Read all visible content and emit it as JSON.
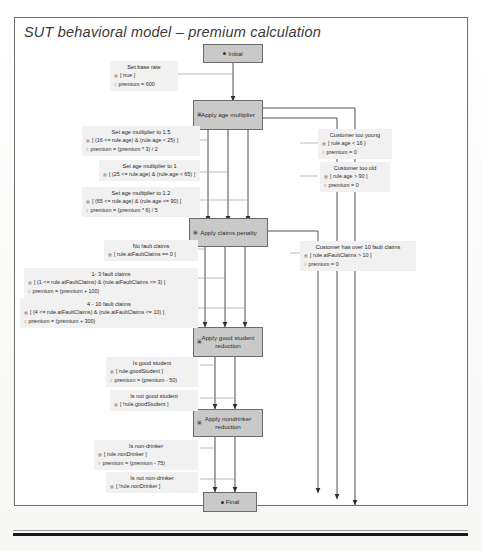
{
  "document": {
    "figure_title": "SUT behavioral model – premium calculation"
  },
  "diagram": {
    "type": "uml-state-machine",
    "palette": {
      "node_fill": "#c9c9c9",
      "node_stroke": "#6a6a6a",
      "label_fill": "#f1f1f1",
      "edge_stroke": "#3a3a3a",
      "frame_stroke": "#6f6f6f",
      "rule_color": "#1a1a1a"
    },
    "nodes": [
      {
        "id": "initial",
        "label": "Initial",
        "kind": "initial-pseudostate"
      },
      {
        "id": "age",
        "label": "Apply age multiplier",
        "kind": "state"
      },
      {
        "id": "claims",
        "label": "Apply claims penalty",
        "kind": "state"
      },
      {
        "id": "student",
        "label": "Apply good student reduction",
        "kind": "state"
      },
      {
        "id": "drinker",
        "label": "Apply nondrinker reduction",
        "kind": "state"
      },
      {
        "id": "final",
        "label": "Final",
        "kind": "final-state"
      }
    ],
    "transitions": [
      {
        "id": "t-base-rate",
        "name": "Set base rate",
        "guard": "[ true ]",
        "effect": "premium = 600",
        "from": "initial",
        "to": "age"
      },
      {
        "id": "t-age-15",
        "name": "Set age multiplier to 1.5",
        "guard": "[ (16 <= rule.age) & (rule.age < 25) ]",
        "effect": "premium = (premium * 3) / 2",
        "from": "age",
        "to": "claims"
      },
      {
        "id": "t-age-1",
        "name": "Set age multiplier to 1",
        "guard": "[ (25 <= rule.age) & (rule.age < 65) ]",
        "effect": "",
        "from": "age",
        "to": "claims"
      },
      {
        "id": "t-age-12",
        "name": "Set age multiplier to 1.2",
        "guard": "[ (65 <= rule.age) & (rule.age <= 90) ]",
        "effect": "premium = (premium * 6) / 5",
        "from": "age",
        "to": "claims"
      },
      {
        "id": "t-too-young",
        "name": "Customer too young",
        "guard": "[ rule.age < 16 ]",
        "effect": "premium = 0",
        "from": "age",
        "to": "final"
      },
      {
        "id": "t-too-old",
        "name": "Customer too old",
        "guard": "[ rule.age > 90 ]",
        "effect": "premium = 0",
        "from": "age",
        "to": "final"
      },
      {
        "id": "t-no-claims",
        "name": "No fault claims",
        "guard": "[ rule.atFaultClaims == 0 ]",
        "effect": "",
        "from": "claims",
        "to": "student"
      },
      {
        "id": "t-claims-1-3",
        "name": "1- 3 fault claims",
        "guard": "[ (1 <= rule.atFaultClaims) & (rule.atFaultClaims <= 3) ]",
        "effect": "premium = (premium + 100)",
        "from": "claims",
        "to": "student"
      },
      {
        "id": "t-claims-4-10",
        "name": "4 - 10 fault claims",
        "guard": "[ (4 <= rule.atFaultClaims) & (rule.atFaultClaims <= 10) ]",
        "effect": "premium = (premium + 300)",
        "from": "claims",
        "to": "student"
      },
      {
        "id": "t-over-10-claims",
        "name": "Customer has over 10 fault claims",
        "guard": "[ rule.atFaultClaims > 10 ]",
        "effect": "premium = 0",
        "from": "claims",
        "to": "final"
      },
      {
        "id": "t-good-student",
        "name": "Is good student",
        "guard": "[ rule.goodStudent ]",
        "effect": "premium = (premium - 50)",
        "from": "student",
        "to": "drinker"
      },
      {
        "id": "t-not-good-student",
        "name": "Is not good student",
        "guard": "[ !rule.goodStudent ]",
        "effect": "",
        "from": "student",
        "to": "drinker"
      },
      {
        "id": "t-non-drinker",
        "name": "Is non-drinker",
        "guard": "[ rule.nonDrinker ]",
        "effect": "premium = (premium - 75)",
        "from": "drinker",
        "to": "final"
      },
      {
        "id": "t-not-non-drinker",
        "name": "Is not non-drinker",
        "guard": "[ !rule.nonDrinker ]",
        "effect": "",
        "from": "drinker",
        "to": "final"
      }
    ],
    "icons": {
      "guard": "▦",
      "effect": "≡",
      "state_badge": "▣",
      "pseudostate_dot": "●"
    }
  }
}
